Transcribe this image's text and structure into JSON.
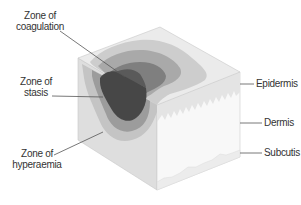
{
  "diagram": {
    "type": "skin-block-burn-zones",
    "labels": {
      "coagulation": [
        "Zone of",
        "coagulation"
      ],
      "stasis": [
        "Zone of",
        "stasis"
      ],
      "hyperaemia": [
        "Zone of",
        "hyperaemia"
      ],
      "epidermis": "Epidermis",
      "dermis": "Dermis",
      "subcutis": "Subcutis"
    },
    "colors": {
      "coagulation": "#4a4a4a",
      "stasis": "#7d7d7d",
      "hyperaemia": "#a6a6a6",
      "outer_zone": "#c4c4c4",
      "cube_top": "#e6e6e6",
      "cube_left": "#dcdcdc",
      "cube_right": "#f7f7f7",
      "leader_line": "#555555"
    }
  }
}
